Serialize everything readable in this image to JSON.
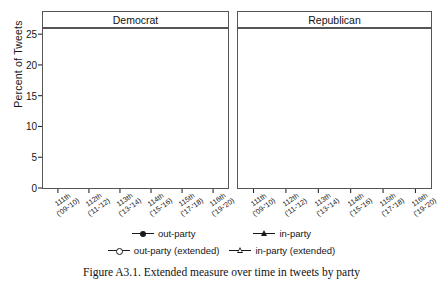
{
  "figure": {
    "caption": "Figure A3.1. Extended measure over time in tweets by party",
    "ylabel": "Percent of Tweets",
    "panels": [
      "Democrat",
      "Republican"
    ]
  },
  "colors": {
    "line": "#1a1a1a",
    "frame": "#555555",
    "background": "#ffffff",
    "marker_fill_open": "#ffffff",
    "marker_fill_solid": "#1a1a1a"
  },
  "legend": {
    "position": "bottom",
    "entries": [
      {
        "label": "out-party",
        "marker": "filled-circle"
      },
      {
        "label": "in-party",
        "marker": "filled-triangle"
      },
      {
        "label": "out-party (extended)",
        "marker": "open-circle"
      },
      {
        "label": "in-party (extended)",
        "marker": "open-triangle"
      }
    ]
  },
  "chart_data": {
    "type": "line",
    "title": "Extended measure over time in tweets by party",
    "xlabel": "",
    "ylabel": "Percent of Tweets",
    "ylim": [
      0,
      26
    ],
    "yticks": [
      0,
      5,
      10,
      15,
      20,
      25
    ],
    "grid": false,
    "legend_position": "bottom",
    "categories": [
      "111th",
      "112th",
      "113th",
      "114th",
      "115th",
      "116th"
    ],
    "category_sublabels": [
      "('09-'10)",
      "('11-'12)",
      "('13-'14)",
      "('15-'16)",
      "('17-'18)",
      "('19-'20)"
    ],
    "panels": [
      {
        "name": "Democrat",
        "series": [
          {
            "name": "out-party",
            "marker": "filled-circle",
            "values": [
              1.1,
              3.9,
              2.8,
              1.8,
              5.5,
              2.7
            ]
          },
          {
            "name": "in-party",
            "marker": "filled-triangle",
            "values": [
              0.4,
              0.8,
              0.8,
              0.7,
              2.2,
              2.3
            ]
          },
          {
            "name": "out-party (extended)",
            "marker": "open-circle",
            "values": [
              0.9,
              4.2,
              4.6,
              4.2,
              15.2,
              13.5
            ]
          },
          {
            "name": "in-party (extended)",
            "marker": "open-triangle",
            "values": [
              7.5,
              12.7,
              18.5,
              12.2,
              14.2,
              15.4
            ]
          }
        ]
      },
      {
        "name": "Republican",
        "series": [
          {
            "name": "out-party",
            "marker": "filled-circle",
            "values": [
              2.4,
              0.7,
              0.8,
              0.6,
              1.1,
              6.1
            ]
          },
          {
            "name": "in-party",
            "marker": "filled-triangle",
            "values": [
              5.2,
              5.5,
              1.9,
              0.9,
              1.2,
              2.6
            ]
          },
          {
            "name": "out-party (extended)",
            "marker": "open-circle",
            "values": [
              8.4,
              6.1,
              5.6,
              3.9,
              3.8,
              13.7
            ]
          },
          {
            "name": "in-party (extended)",
            "marker": "open-triangle",
            "values": [
              7.8,
              12.0,
              13.7,
              13.9,
              16.6,
              20.3
            ]
          }
        ]
      }
    ]
  }
}
